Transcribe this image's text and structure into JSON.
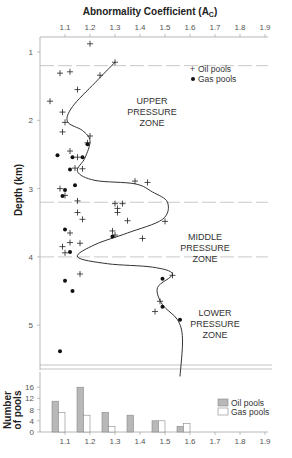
{
  "chart_data": [
    {
      "type": "scatter",
      "title": "Abnormality Coefficient (A_C)",
      "title_main": "Abnormality Coefficient (A",
      "title_sub": "C",
      "title_close": ")",
      "xlabel": "Abnormality Coefficient (A_C)",
      "ylabel": "Depth (km)",
      "xlim": [
        1.0,
        1.9
      ],
      "ylim": [
        0.7,
        5.9
      ],
      "x_ticks": [
        "1.1",
        "1.2",
        "1.3",
        "1.4",
        "1.5",
        "1.6",
        "1.7",
        "1.8",
        "1.9"
      ],
      "y_ticks": [
        "1",
        "2",
        "3",
        "4",
        "5"
      ],
      "legend": [
        {
          "symbol": "+",
          "label": "Oil pools"
        },
        {
          "symbol": "●",
          "label": "Gas pools"
        }
      ],
      "zones": [
        {
          "label": [
            "UPPER",
            "PRESSURE",
            "ZONE"
          ],
          "top_km": 0.7,
          "bottom_km": 1.2
        },
        {
          "label": [
            "MIDDLE",
            "PRESSURE",
            "ZONE"
          ],
          "top_km": 3.2,
          "bottom_km": 4.0
        },
        {
          "label": [
            "LOWER",
            "PRESSURE",
            "ZONE"
          ],
          "top_km": 4.0,
          "bottom_km": 5.9
        }
      ],
      "zone_boundaries_km": [
        1.2,
        3.2,
        4.0
      ],
      "series": [
        {
          "name": "Oil pools",
          "marker": "+",
          "points": [
            [
              1.2,
              0.88
            ],
            [
              1.3,
              1.15
            ],
            [
              1.08,
              1.31
            ],
            [
              1.12,
              1.29
            ],
            [
              1.24,
              1.34
            ],
            [
              1.15,
              1.55
            ],
            [
              1.04,
              1.72
            ],
            [
              1.09,
              1.88
            ],
            [
              1.1,
              2.03
            ],
            [
              1.09,
              2.17
            ],
            [
              1.2,
              2.23
            ],
            [
              1.19,
              2.33
            ],
            [
              1.12,
              2.45
            ],
            [
              1.15,
              2.54
            ],
            [
              1.17,
              2.71
            ],
            [
              1.14,
              2.7
            ],
            [
              1.38,
              2.89
            ],
            [
              1.43,
              2.91
            ],
            [
              1.08,
              3.0
            ],
            [
              1.1,
              3.1
            ],
            [
              1.15,
              3.18
            ],
            [
              1.3,
              3.22
            ],
            [
              1.33,
              3.22
            ],
            [
              1.31,
              3.29
            ],
            [
              1.31,
              3.35
            ],
            [
              1.15,
              3.35
            ],
            [
              1.17,
              3.45
            ],
            [
              1.35,
              3.47
            ],
            [
              1.29,
              3.62
            ],
            [
              1.12,
              3.65
            ],
            [
              1.3,
              3.68
            ],
            [
              1.41,
              3.73
            ],
            [
              1.5,
              3.48
            ],
            [
              1.12,
              3.79
            ],
            [
              1.16,
              3.8
            ],
            [
              1.09,
              3.85
            ],
            [
              1.1,
              3.94
            ],
            [
              1.53,
              4.27
            ],
            [
              1.16,
              4.25
            ],
            [
              1.48,
              4.65
            ],
            [
              1.46,
              4.8
            ]
          ]
        },
        {
          "name": "Gas pools",
          "marker": "dot",
          "points": [
            [
              1.19,
              2.35
            ],
            [
              1.07,
              2.51
            ],
            [
              1.13,
              2.54
            ],
            [
              1.17,
              2.54
            ],
            [
              1.12,
              2.72
            ],
            [
              1.14,
              2.95
            ],
            [
              1.1,
              3.02
            ],
            [
              1.09,
              3.11
            ],
            [
              1.1,
              3.6
            ],
            [
              1.29,
              3.7
            ],
            [
              1.12,
              3.93
            ],
            [
              1.1,
              4.35
            ],
            [
              1.13,
              4.5
            ],
            [
              1.49,
              4.32
            ],
            [
              1.49,
              4.73
            ],
            [
              1.56,
              4.92
            ],
            [
              1.08,
              5.38
            ]
          ]
        }
      ],
      "trend_line": {
        "name": "Abnormality trend",
        "points": [
          [
            1.3,
            1.15
          ],
          [
            1.22,
            1.45
          ],
          [
            1.13,
            1.8
          ],
          [
            1.11,
            2.02
          ],
          [
            1.17,
            2.15
          ],
          [
            1.2,
            2.3
          ],
          [
            1.18,
            2.55
          ],
          [
            1.15,
            2.75
          ],
          [
            1.22,
            2.88
          ],
          [
            1.38,
            2.93
          ],
          [
            1.45,
            3.05
          ],
          [
            1.51,
            3.2
          ],
          [
            1.49,
            3.45
          ],
          [
            1.35,
            3.65
          ],
          [
            1.22,
            3.82
          ],
          [
            1.15,
            4.0
          ],
          [
            1.27,
            4.1
          ],
          [
            1.45,
            4.15
          ],
          [
            1.53,
            4.25
          ],
          [
            1.47,
            4.45
          ],
          [
            1.49,
            4.7
          ],
          [
            1.55,
            4.92
          ],
          [
            1.57,
            5.2
          ],
          [
            1.56,
            5.75
          ]
        ]
      }
    },
    {
      "type": "bar",
      "title": "",
      "xlabel": "",
      "ylabel": "Number of pools",
      "ylabel_lines": [
        "Number",
        "of pools"
      ],
      "ylim": [
        0,
        18
      ],
      "y_ticks": [
        "0",
        "4",
        "8",
        "12",
        "16"
      ],
      "x_ticks": [
        "1.1",
        "1.2",
        "1.3",
        "1.4",
        "1.5",
        "1.6",
        "1.7",
        "1.8",
        "1.9"
      ],
      "categories": [
        "1.0–1.1",
        "1.1–1.2",
        "1.2–1.3",
        "1.3–1.4",
        "1.4–1.5",
        "1.5–1.6"
      ],
      "series": [
        {
          "name": "Oil pools",
          "color": "#b8b8b8",
          "values": [
            11,
            16,
            7,
            6,
            4,
            2
          ]
        },
        {
          "name": "Gas pools",
          "color": "#ffffff",
          "values": [
            7,
            6,
            2,
            0,
            4,
            3
          ]
        }
      ],
      "legend": [
        {
          "label": "Oil pools",
          "color": "#b8b8b8"
        },
        {
          "label": "Gas pools",
          "color": "#ffffff"
        }
      ]
    }
  ],
  "colors": {
    "axis": "#999999",
    "zone_line": "#bbbbbb",
    "curve": "#333333",
    "oil_bar": "#b8b8b8",
    "gas_bar": "#ffffff",
    "bar_border": "#888888"
  }
}
